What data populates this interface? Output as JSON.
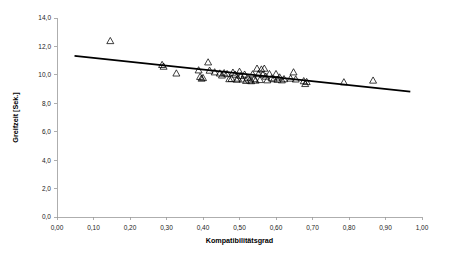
{
  "chart_data": {
    "type": "scatter",
    "title": "",
    "xlabel": "Kompatibilitätsgrad",
    "ylabel": "Greifzeit [Sek.]",
    "xlim": [
      0.0,
      1.0
    ],
    "ylim": [
      0.0,
      14.0
    ],
    "grid": false,
    "legend": null,
    "marker": "triangle-open",
    "xticks": [
      0.0,
      0.1,
      0.2,
      0.3,
      0.4,
      0.5,
      0.6,
      0.7,
      0.8,
      0.9,
      1.0
    ],
    "xticklabels": [
      "0,00",
      "0,10",
      "0,20",
      "0,30",
      "0,40",
      "0,50",
      "0,60",
      "0,70",
      "0,80",
      "0,90",
      "1,00"
    ],
    "yticks": [
      0.0,
      2.0,
      4.0,
      6.0,
      8.0,
      10.0,
      12.0,
      14.0
    ],
    "yticklabels": [
      "0,0",
      "2,0",
      "4,0",
      "6,0",
      "8,0",
      "10,0",
      "12,0",
      "14,0"
    ],
    "points": [
      [
        0.146,
        12.38
      ],
      [
        0.288,
        10.7
      ],
      [
        0.292,
        10.58
      ],
      [
        0.327,
        10.1
      ],
      [
        0.388,
        10.32
      ],
      [
        0.392,
        9.86
      ],
      [
        0.396,
        9.74
      ],
      [
        0.4,
        9.78
      ],
      [
        0.414,
        10.88
      ],
      [
        0.418,
        10.3
      ],
      [
        0.432,
        10.18
      ],
      [
        0.446,
        10.1
      ],
      [
        0.452,
        9.96
      ],
      [
        0.458,
        10.12
      ],
      [
        0.466,
        10.06
      ],
      [
        0.472,
        9.7
      ],
      [
        0.478,
        9.72
      ],
      [
        0.482,
        10.16
      ],
      [
        0.488,
        10.02
      ],
      [
        0.492,
        9.66
      ],
      [
        0.496,
        9.74
      ],
      [
        0.5,
        10.22
      ],
      [
        0.504,
        9.92
      ],
      [
        0.508,
        9.68
      ],
      [
        0.514,
        10.02
      ],
      [
        0.518,
        9.58
      ],
      [
        0.522,
        9.8
      ],
      [
        0.528,
        9.62
      ],
      [
        0.532,
        9.56
      ],
      [
        0.536,
        10.04
      ],
      [
        0.54,
        9.7
      ],
      [
        0.544,
        9.6
      ],
      [
        0.548,
        10.44
      ],
      [
        0.552,
        10.06
      ],
      [
        0.556,
        9.64
      ],
      [
        0.56,
        10.38
      ],
      [
        0.564,
        10.02
      ],
      [
        0.568,
        10.44
      ],
      [
        0.572,
        9.88
      ],
      [
        0.576,
        9.62
      ],
      [
        0.582,
        10.06
      ],
      [
        0.588,
        9.76
      ],
      [
        0.594,
        9.7
      ],
      [
        0.6,
        10.06
      ],
      [
        0.604,
        9.66
      ],
      [
        0.61,
        9.82
      ],
      [
        0.616,
        9.62
      ],
      [
        0.622,
        9.7
      ],
      [
        0.64,
        9.74
      ],
      [
        0.648,
        10.18
      ],
      [
        0.654,
        9.68
      ],
      [
        0.676,
        9.56
      ],
      [
        0.68,
        9.36
      ],
      [
        0.684,
        9.5
      ],
      [
        0.786,
        9.48
      ],
      [
        0.866,
        9.6
      ]
    ],
    "regression": {
      "label": "linear-fit",
      "x_start": 0.048,
      "y_start": 11.33,
      "x_end": 0.968,
      "y_end": 8.82
    }
  }
}
